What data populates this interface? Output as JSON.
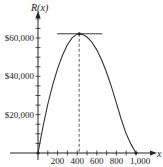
{
  "chart_data": {
    "type": "line",
    "title": "",
    "xlabel": "x",
    "ylabel": "R(x)",
    "xlim": [
      0,
      1000
    ],
    "ylim": [
      0,
      70000
    ],
    "x_ticks": [
      200,
      400,
      600,
      800,
      1000
    ],
    "x_tick_labels": [
      "200",
      "400",
      "600",
      "800",
      "1,000"
    ],
    "y_ticks": [
      20000,
      40000,
      60000
    ],
    "y_tick_labels": [
      "$20,000",
      "$40,000",
      "$60,000"
    ],
    "grid": false,
    "legend": null,
    "series": [
      {
        "name": "R(x)",
        "x": [
          0,
          50,
          100,
          150,
          200,
          250,
          300,
          350,
          400,
          420,
          450,
          500,
          550,
          600,
          650,
          700,
          750,
          800,
          850,
          900,
          950,
          1000
        ],
        "y": [
          0,
          13500,
          25500,
          35500,
          44000,
          51000,
          56500,
          60200,
          62000,
          62200,
          61900,
          60500,
          57800,
          53800,
          48500,
          42000,
          34500,
          26000,
          17500,
          10000,
          4500,
          0
        ]
      }
    ],
    "annotations": [
      {
        "type": "horizontal_tangent",
        "at_x": 420,
        "y": 62200,
        "description": "tangent line at maximum"
      },
      {
        "type": "dashed_vertical",
        "at_x": 420,
        "description": "dashed line from maximum down to x-axis"
      },
      {
        "type": "point",
        "x": 0,
        "y": 0
      },
      {
        "type": "point",
        "x": 1000,
        "y": 0
      }
    ]
  }
}
